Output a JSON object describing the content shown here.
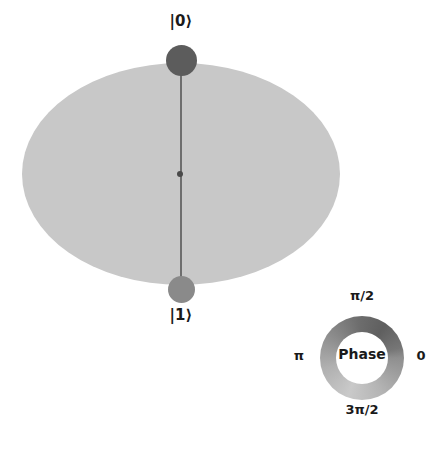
{
  "figure": {
    "type": "qsphere",
    "title": "",
    "background_color": "#ffffff"
  },
  "qsphere": {
    "disk_color": "#c8c8c8",
    "meridian_color": "#6e6e6e",
    "center_dot_color": "#4a4a4a",
    "states": [
      {
        "label": "|0⟩",
        "position": "top",
        "marker_color": "#5c5c5c",
        "marker_radius_px": 15,
        "amplitude_note": ""
      },
      {
        "label": "|1⟩",
        "position": "bottom",
        "marker_color": "#8a8a8a",
        "marker_radius_px": 13,
        "amplitude_note": ""
      }
    ]
  },
  "phase_legend": {
    "center_label": "Phase",
    "ticks": [
      {
        "label": "π/2",
        "position": "top"
      },
      {
        "label": "π",
        "position": "left"
      },
      {
        "label": "0",
        "position": "right"
      },
      {
        "label": "3π/2",
        "position": "bottom"
      }
    ],
    "ring_colors": {
      "light": "#c9c9c9",
      "mid": "#8f8f8f",
      "dark": "#5f5f5f"
    }
  },
  "chart_data": {
    "type": "scatter",
    "title": "",
    "subtitle": "",
    "xlabel": "",
    "ylabel": "",
    "categories": [
      "|0⟩",
      "|1⟩"
    ],
    "values": [
      1,
      1
    ],
    "annotations": [
      "|0⟩",
      "|1⟩",
      "Phase",
      "π/2",
      "π",
      "0",
      "3π/2"
    ],
    "legend_position": "bottom-right",
    "grid": false
  }
}
